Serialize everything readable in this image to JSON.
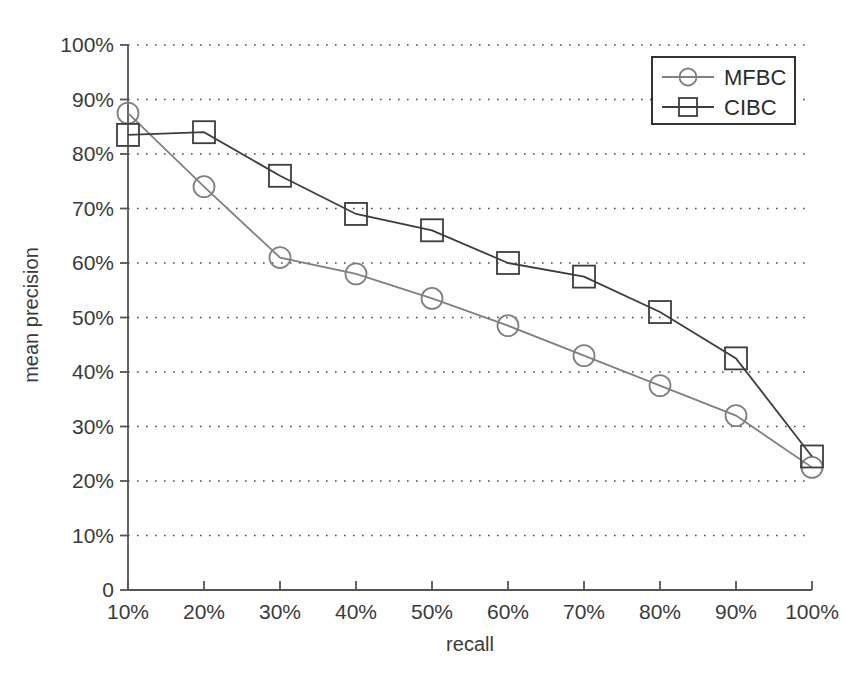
{
  "chart_data": {
    "type": "line",
    "title": "",
    "xlabel": "recall",
    "ylabel": "mean precision",
    "categories": [
      "10%",
      "20%",
      "30%",
      "40%",
      "50%",
      "60%",
      "70%",
      "80%",
      "90%",
      "100%"
    ],
    "x": [
      10,
      20,
      30,
      40,
      50,
      60,
      70,
      80,
      90,
      100
    ],
    "xlim": [
      10,
      100
    ],
    "ylim": [
      0,
      100
    ],
    "grid": true,
    "legend_position": "top-right",
    "x_tick_labels": [
      "10%",
      "20%",
      "30%",
      "40%",
      "50%",
      "60%",
      "70%",
      "80%",
      "90%",
      "100%"
    ],
    "y_tick_labels": [
      "0",
      "10%",
      "20%",
      "30%",
      "40%",
      "50%",
      "60%",
      "70%",
      "80%",
      "90%",
      "100%"
    ],
    "y_ticks": [
      0,
      10,
      20,
      30,
      40,
      50,
      60,
      70,
      80,
      90,
      100
    ],
    "origin_label": "0",
    "series": [
      {
        "name": "MFBC",
        "marker": "circle",
        "color": "#808080",
        "values": [
          87.5,
          74.0,
          61.0,
          58.0,
          53.5,
          48.5,
          43.0,
          37.5,
          32.0,
          22.5
        ]
      },
      {
        "name": "CIBC",
        "marker": "square",
        "color": "#3d3d3d",
        "values": [
          83.5,
          84.0,
          76.0,
          69.0,
          66.0,
          60.0,
          57.5,
          51.0,
          42.5,
          24.5
        ]
      }
    ]
  },
  "legend": {
    "entries": [
      {
        "label": "MFBC"
      },
      {
        "label": "CIBC"
      }
    ]
  },
  "axes": {
    "x_title": "recall",
    "y_title": "mean precision"
  }
}
